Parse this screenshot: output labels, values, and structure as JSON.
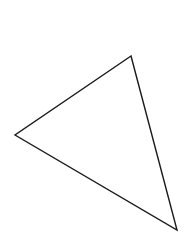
{
  "diagram": {
    "background": "#ffffff",
    "shapes": [
      {
        "type": "triangle",
        "fill": "none",
        "stroke": "#1a1a1a",
        "stroke_width": 1.4,
        "vertices": [
          {
            "x": 131,
            "y": 56
          },
          {
            "x": 15,
            "y": 135
          },
          {
            "x": 177,
            "y": 230
          }
        ],
        "points": "131,56 15,135 177,230"
      }
    ]
  }
}
